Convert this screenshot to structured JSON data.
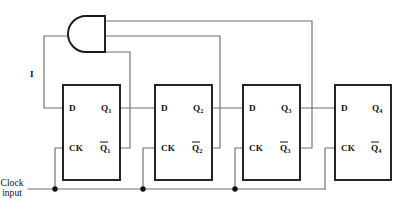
{
  "diagram": {
    "canvas": {
      "width": 405,
      "height": 207,
      "background": "#ffffff"
    },
    "colors": {
      "wire": "#6e6e6e",
      "outline": "#1a1a1a",
      "text": "#111111",
      "background": "#ffffff"
    }
  },
  "gate": {
    "type": "AND",
    "orientation": "mirrored-output-left",
    "input_count": 3,
    "output_signal_label": "I"
  },
  "signals": {
    "feedback_label": "I",
    "clock_label_line1": "Clock",
    "clock_label_line2": "input"
  },
  "flipflops": [
    {
      "index": 1,
      "d_label": "D",
      "ck_label": "CK",
      "q_label": "Q",
      "q_subscript": "1",
      "qbar_label": "Q",
      "qbar_subscript": "1",
      "qbar_has_overbar": true
    },
    {
      "index": 2,
      "d_label": "D",
      "ck_label": "CK",
      "q_label": "Q",
      "q_subscript": "2",
      "qbar_label": "Q",
      "qbar_subscript": "2",
      "qbar_has_overbar": true
    },
    {
      "index": 3,
      "d_label": "D",
      "ck_label": "CK",
      "q_label": "Q",
      "q_subscript": "3",
      "qbar_label": "Q",
      "qbar_subscript": "3",
      "qbar_has_overbar": true
    },
    {
      "index": 4,
      "d_label": "D",
      "ck_label": "CK",
      "q_label": "Q",
      "q_subscript": "4",
      "qbar_label": "Q",
      "qbar_subscript": "4",
      "qbar_has_overbar": true
    }
  ],
  "connections": [
    {
      "from": "AND-gate-output",
      "to": "FF1-D",
      "via_label": "I"
    },
    {
      "from": "FF1-Q1",
      "to": "FF2-D"
    },
    {
      "from": "FF2-Q2",
      "to": "FF3-D"
    },
    {
      "from": "FF3-Q3",
      "to": "FF4-D"
    },
    {
      "from": "FF1-Q1bar",
      "to": "AND-gate-input-3"
    },
    {
      "from": "FF2-Q2bar",
      "to": "AND-gate-input-2"
    },
    {
      "from": "FF3-Q3bar",
      "to": "AND-gate-input-1"
    },
    {
      "from": "Clock-input",
      "to": "FF1-CK"
    },
    {
      "from": "Clock-input",
      "to": "FF2-CK"
    },
    {
      "from": "Clock-input",
      "to": "FF3-CK"
    },
    {
      "from": "Clock-input",
      "to": "FF4-CK"
    }
  ]
}
